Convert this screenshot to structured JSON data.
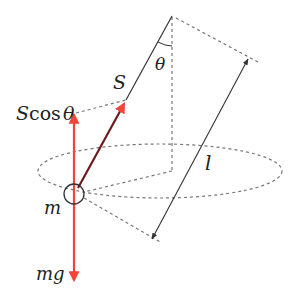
{
  "diagram": {
    "labels": {
      "tension": "S",
      "vertical_component_prefix": "S",
      "vertical_component_func": "cos",
      "vertical_component_angle": "θ",
      "angle": "θ",
      "length": "l",
      "mass": "m",
      "weight": "mg"
    },
    "colors": {
      "force": "#f0453a",
      "tension_line": "#5a1a1a",
      "line": "#333333",
      "dashed": "#777777"
    }
  }
}
